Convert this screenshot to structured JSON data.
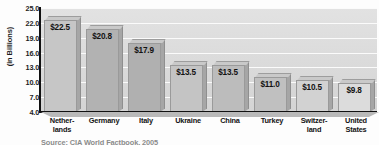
{
  "chart_data": {
    "type": "bar",
    "title": "",
    "xlabel": "",
    "ylabel": "(in Billions)",
    "categories": [
      "Nether-\nlands",
      "Germany",
      "Italy",
      "Ukraine",
      "China",
      "Turkey",
      "Switzer-\nland",
      "United\nStates"
    ],
    "values": [
      22.5,
      20.8,
      17.9,
      13.5,
      13.5,
      11.0,
      10.5,
      9.8
    ],
    "value_labels": [
      "$22.5",
      "$20.8",
      "$17.9",
      "$13.5",
      "$13.5",
      "$11.0",
      "$10.5",
      "$9.8"
    ],
    "ylim": [
      4.0,
      25.0
    ],
    "ytick_labels": [
      "25.0",
      "22.0",
      "19.0",
      "16.0",
      "13.0",
      "10.0",
      "7.0",
      "4.0"
    ],
    "yticks": [
      25.0,
      22.0,
      19.0,
      16.0,
      13.0,
      10.0,
      7.0,
      4.0
    ],
    "grid": true,
    "legend": false,
    "bar_colors": [
      "#c6c6c6",
      "#b2b2b2",
      "#b0b0b0",
      "#c4c4c4",
      "#bcbcbc",
      "#c0c0c0",
      "#d2d2d2",
      "#dcdcdc"
    ],
    "plot_background": "#dcdcdc",
    "gridline_color": "#fbfbfb",
    "axis_color": "#111111",
    "text_color": "#141414"
  },
  "source": {
    "note": "Source: CIA World Factbook, 2005"
  }
}
